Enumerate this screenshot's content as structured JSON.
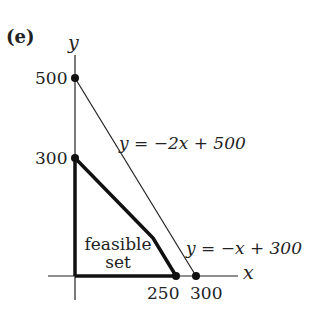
{
  "panel_label": "(e)",
  "axes": {
    "x_label": "x",
    "y_label": "y"
  },
  "ticks": {
    "y": [
      "500",
      "300"
    ],
    "x": [
      "250",
      "300"
    ]
  },
  "lines": [
    {
      "equation": "y = −2x + 500",
      "x_intercept": 250,
      "y_intercept": 500
    },
    {
      "equation": "y = −x + 300",
      "x_intercept": 300,
      "y_intercept": 300
    }
  ],
  "region": {
    "label_line1": "feasible",
    "label_line2": "set",
    "vertices": [
      [
        0,
        0
      ],
      [
        0,
        300
      ],
      [
        200,
        100
      ],
      [
        250,
        0
      ]
    ]
  },
  "colors": {
    "ink": "#111111",
    "background": "#ffffff"
  }
}
